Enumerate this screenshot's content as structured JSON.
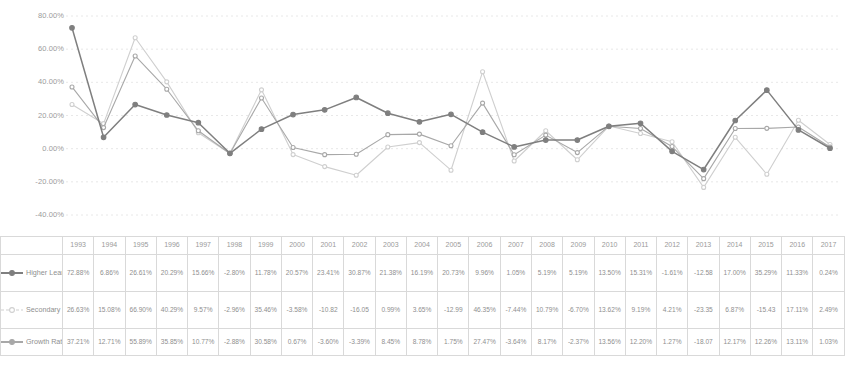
{
  "chart_data": {
    "type": "line",
    "title": "",
    "xlabel": "",
    "ylabel": "",
    "ylim": [
      -40,
      80
    ],
    "ytick_labels": [
      "80.00%",
      "60.00%",
      "40.00%",
      "20.00%",
      "0.00%",
      "-20.00%",
      "-40.00%"
    ],
    "ytick_values": [
      80,
      60,
      40,
      20,
      0,
      -20,
      -40
    ],
    "grid": true,
    "legend_position": "bottom-left",
    "marker": "circle",
    "categories": [
      "1993",
      "1994",
      "1995",
      "1996",
      "1997",
      "1998",
      "1999",
      "2000",
      "2001",
      "2002",
      "2003",
      "2004",
      "2005",
      "2006",
      "2007",
      "2008",
      "2009",
      "2010",
      "2011",
      "2012",
      "2013",
      "2014",
      "2015",
      "2016",
      "2017"
    ],
    "series": [
      {
        "name": "Higher Learning Institutes",
        "color": "#7f7f7f",
        "values": [
          72.88,
          6.86,
          26.61,
          20.29,
          15.66,
          -2.8,
          11.78,
          20.57,
          23.41,
          30.87,
          21.38,
          16.19,
          20.73,
          9.96,
          1.05,
          5.19,
          5.19,
          13.5,
          15.31,
          -1.61,
          -12.58,
          17.0,
          35.29,
          11.33,
          0.24
        ],
        "labels": [
          "72.88%",
          "6.86%",
          "26.61%",
          "20.29%",
          "15.66%",
          "-2.80%",
          "11.78%",
          "20.57%",
          "23.41%",
          "30.87%",
          "21.38%",
          "16.19%",
          "20.73%",
          "9.96%",
          "1.05%",
          "5.19%",
          "5.19%",
          "13.50%",
          "15.31%",
          "-1.61%",
          "-12.58",
          "17.00%",
          "35.29%",
          "11.33%",
          "0.24%"
        ]
      },
      {
        "name": "Secondary Vocational School",
        "color": "#cfcfcf",
        "values": [
          26.63,
          15.08,
          66.9,
          40.29,
          9.57,
          -2.96,
          35.46,
          -3.58,
          -10.82,
          -16.05,
          0.99,
          3.65,
          -12.99,
          46.35,
          -7.44,
          10.79,
          -6.7,
          13.62,
          9.19,
          4.21,
          -23.35,
          6.87,
          -15.43,
          17.11,
          2.49
        ],
        "labels": [
          "26.63%",
          "15.08%",
          "66.90%",
          "40.29%",
          "9.57%",
          "-2.96%",
          "35.46%",
          "-3.58%",
          "-10.82",
          "-16.05",
          "0.99%",
          "3.65%",
          "-12.99",
          "46.35%",
          "-7.44%",
          "10.79%",
          "-6.70%",
          "13.62%",
          "9.19%",
          "4.21%",
          "-23.35",
          "6.87%",
          "-15.43",
          "17.11%",
          "2.49%"
        ]
      },
      {
        "name": "Growth Rate",
        "color": "#a8a8a8",
        "values": [
          37.21,
          12.71,
          55.89,
          35.85,
          10.77,
          -2.88,
          30.58,
          0.67,
          -3.6,
          -3.39,
          8.45,
          8.78,
          1.75,
          27.47,
          -3.64,
          8.17,
          -2.37,
          13.56,
          12.2,
          1.27,
          -18.07,
          12.17,
          12.26,
          13.11,
          1.03
        ],
        "labels": [
          "37.21%",
          "12.71%",
          "55.89%",
          "35.85%",
          "10.77%",
          "-2.88%",
          "30.58%",
          "0.67%",
          "-3.60%",
          "-3.39%",
          "8.45%",
          "8.78%",
          "1.75%",
          "27.47%",
          "-3.64%",
          "8.17%",
          "-2.37%",
          "13.56%",
          "12.20%",
          "1.27%",
          "-18.07",
          "12.17%",
          "12.26%",
          "13.11%",
          "1.03%"
        ]
      }
    ]
  },
  "table": {
    "corner_label": "",
    "year_header": [
      "1993",
      "1994",
      "1995",
      "1996",
      "1997",
      "1998",
      "1999",
      "2000",
      "2001",
      "2002",
      "2003",
      "2004",
      "2005",
      "2006",
      "2007",
      "2008",
      "2009",
      "2010",
      "2011",
      "2012",
      "2013",
      "2014",
      "2015",
      "2016",
      "2017"
    ],
    "rows": [
      {
        "name": "Higher Learning Institutes",
        "values": [
          "72.88%",
          "6.86%",
          "26.61%",
          "20.29%",
          "15.66%",
          "-2.80%",
          "11.78%",
          "20.57%",
          "23.41%",
          "30.87%",
          "21.38%",
          "16.19%",
          "20.73%",
          "9.96%",
          "1.05%",
          "5.19%",
          "5.19%",
          "13.50%",
          "15.31%",
          "-1.61%",
          "-12.58",
          "17.00%",
          "35.29%",
          "11.33%",
          "0.24%"
        ]
      },
      {
        "name": "Secondary Vocational School",
        "values": [
          "26.63%",
          "15.08%",
          "66.90%",
          "40.29%",
          "9.57%",
          "-2.96%",
          "35.46%",
          "-3.58%",
          "-10.82",
          "-16.05",
          "0.99%",
          "3.65%",
          "-12.99",
          "46.35%",
          "-7.44%",
          "10.79%",
          "-6.70%",
          "13.62%",
          "9.19%",
          "4.21%",
          "-23.35",
          "6.87%",
          "-15.43",
          "17.11%",
          "2.49%"
        ]
      },
      {
        "name": "Growth Rate",
        "values": [
          "37.21%",
          "12.71%",
          "55.89%",
          "35.85%",
          "10.77%",
          "-2.88%",
          "30.58%",
          "0.67%",
          "-3.60%",
          "-3.39%",
          "8.45%",
          "8.78%",
          "1.75%",
          "27.47%",
          "-3.64%",
          "8.17%",
          "-2.37%",
          "13.56%",
          "12.20%",
          "1.27%",
          "-18.07",
          "12.17%",
          "12.26%",
          "13.11%",
          "1.03%"
        ]
      }
    ]
  }
}
